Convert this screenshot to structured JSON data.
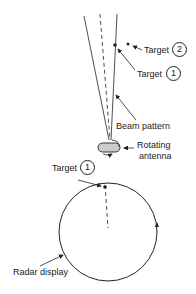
{
  "diagram": {
    "labels": {
      "target2_text": "Target",
      "target2_num": "2",
      "target1_text": "Target",
      "target1_num": "1",
      "beam_pattern": "Beam pattern",
      "antenna_line1": "Rotating",
      "antenna_line2": "antenna",
      "display_target_text": "Target",
      "display_target_num": "1",
      "radar_display": "Radar display"
    },
    "colors": {
      "line": "#222222",
      "background": "#ffffff",
      "antenna_fill": "#cccccc"
    }
  }
}
